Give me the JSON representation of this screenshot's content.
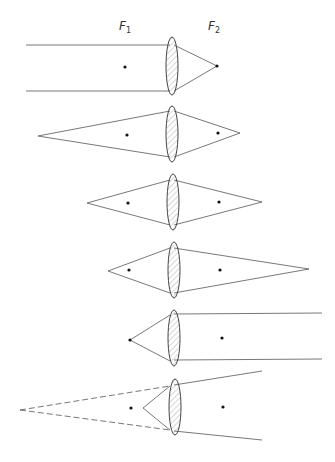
{
  "labels": {
    "f1": {
      "text": "F",
      "sub": "1"
    },
    "f2": {
      "text": "F",
      "sub": "2"
    }
  },
  "colors": {
    "line": "#555555",
    "dot": "#111111",
    "lens_fill": "#e8e8e8"
  },
  "diagrams": [
    {
      "case": "parallel-rays-converge-at-F2"
    },
    {
      "case": "object-beyond-2F-real-image"
    },
    {
      "case": "object-at-2F-real-image-at-2F"
    },
    {
      "case": "object-between-F-and-2F-image-beyond-2F"
    },
    {
      "case": "object-at-F1-parallel-rays-out"
    },
    {
      "case": "object-inside-F1-virtual-image"
    }
  ]
}
